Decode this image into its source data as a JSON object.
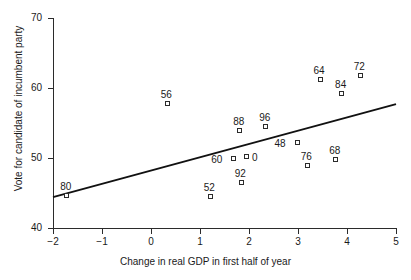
{
  "chart_data": {
    "type": "scatter",
    "title": "",
    "xlabel": "Change in real GDP in first half of year",
    "ylabel": "Vote for candidate of incumbent party",
    "xlim": [
      -2,
      5
    ],
    "ylim": [
      40,
      70
    ],
    "xticks": [
      "-2",
      "-1",
      "0",
      "1",
      "2",
      "3",
      "4",
      "5"
    ],
    "xtick_values": [
      -2,
      -1,
      0,
      1,
      2,
      3,
      4,
      5
    ],
    "yticks": [
      "40",
      "50",
      "60",
      "70"
    ],
    "ytick_values": [
      40,
      50,
      60,
      70
    ],
    "grid": false,
    "legend": "none",
    "marker_style": "open-square",
    "point_label_position": "above-left",
    "points": [
      {
        "label": "80",
        "x": -1.71,
        "y": 44.6,
        "label_dx": -3,
        "label_dy": -12
      },
      {
        "label": "56",
        "x": 0.34,
        "y": 57.7,
        "label_dx": -3,
        "label_dy": -12
      },
      {
        "label": "52",
        "x": 1.22,
        "y": 44.4,
        "label_dx": -3,
        "label_dy": -12
      },
      {
        "label": "60",
        "x": 1.7,
        "y": 49.8,
        "label_dx": -19,
        "label_dy": -2
      },
      {
        "label": "88",
        "x": 1.82,
        "y": 53.9,
        "label_dx": -3,
        "label_dy": -12
      },
      {
        "label": "92",
        "x": 1.85,
        "y": 46.5,
        "label_dx": -3,
        "label_dy": -12
      },
      {
        "label": "0",
        "x": 1.96,
        "y": 50.1,
        "label_dx": 9,
        "label_dy": -2
      },
      {
        "label": "96",
        "x": 2.35,
        "y": 54.5,
        "label_dx": -3,
        "label_dy": -12
      },
      {
        "label": "48",
        "x": 2.99,
        "y": 52.1,
        "label_dx": -19,
        "label_dy": -2
      },
      {
        "label": "76",
        "x": 3.2,
        "y": 48.9,
        "label_dx": -3,
        "label_dy": -12
      },
      {
        "label": "64",
        "x": 3.46,
        "y": 61.2,
        "label_dx": -3,
        "label_dy": -12
      },
      {
        "label": "68",
        "x": 3.78,
        "y": 49.7,
        "label_dx": -3,
        "label_dy": -12
      },
      {
        "label": "84",
        "x": 3.9,
        "y": 59.1,
        "label_dx": -3,
        "label_dy": -12
      },
      {
        "label": "72",
        "x": 4.28,
        "y": 61.7,
        "label_dx": -3,
        "label_dy": -12
      }
    ],
    "fit_line": {
      "type": "linear-regression",
      "x_start": -2,
      "y_start": 44.4,
      "x_end": 5,
      "y_end": 57.7
    }
  }
}
